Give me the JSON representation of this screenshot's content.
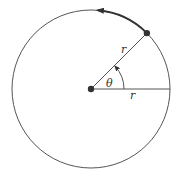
{
  "diagram": {
    "title": "",
    "center": {
      "x": 91,
      "y": 89
    },
    "radius": 79,
    "angle_deg": 45,
    "colors": {
      "stroke": "#555555",
      "thick_arc": "#333333",
      "dot": "#333333",
      "background": "#ffffff"
    },
    "labels": {
      "radius_on_segment": "r",
      "radius_on_horizontal": "r",
      "angle": "θ"
    },
    "elements": [
      {
        "type": "circle",
        "name": "circular-path"
      },
      {
        "type": "dot",
        "name": "center-point"
      },
      {
        "type": "dot",
        "name": "moving-point",
        "at_angle_deg": 45
      },
      {
        "type": "segment",
        "name": "radius-segment-angled"
      },
      {
        "type": "segment",
        "name": "radius-segment-horizontal"
      },
      {
        "type": "arc",
        "name": "angle-arc",
        "arrow": "counterclockwise"
      },
      {
        "type": "arc",
        "name": "motion-arc",
        "arrow": "counterclockwise",
        "from_deg": 45,
        "to_deg": 85
      }
    ]
  }
}
